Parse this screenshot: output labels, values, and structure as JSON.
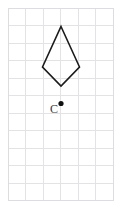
{
  "figure": {
    "background_color": "#ffffff"
  },
  "grid": {
    "name": "square-grid",
    "origin_x": 8,
    "origin_y": 8,
    "cell_size": 17.5,
    "columns": 6,
    "rows": 11,
    "line_color": "#e3e3e6",
    "border_color": "#dddde1",
    "line_width": 1
  },
  "shape": {
    "name": "kite",
    "type": "polygon",
    "vertex_count": 4,
    "stroke_color": "#1b1b1b",
    "stroke_width": 1.6,
    "fill": "none",
    "points": "61,26.5 79.5,67 61,86 42.5,67",
    "vertices": [
      {
        "label": "top",
        "x": 61,
        "y": 26.5
      },
      {
        "label": "right",
        "x": 79.5,
        "y": 67
      },
      {
        "label": "bottom",
        "x": 61,
        "y": 86
      },
      {
        "label": "left",
        "x": 42.5,
        "y": 67
      }
    ]
  },
  "center_point": {
    "name": "point-c",
    "label": "C",
    "x": 61,
    "y": 103.5,
    "radius": 2.6,
    "dot_color": "#111111",
    "label_x": 50,
    "label_y": 113,
    "label_color": "#3a3a3a"
  }
}
